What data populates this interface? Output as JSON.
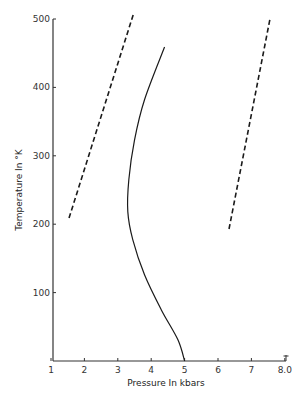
{
  "chart_data": {
    "type": "line",
    "title": "",
    "xlabel": "Pressure In kbars",
    "ylabel": "Temperature In °K",
    "xlim": [
      1,
      8.0
    ],
    "ylim": [
      0,
      500
    ],
    "x_ticks": [
      "1",
      "2",
      "3",
      "4",
      "5",
      "6",
      "7",
      "8.0"
    ],
    "y_ticks": [
      "100",
      "200",
      "300",
      "400",
      "500"
    ],
    "grid": false,
    "legend": null,
    "series": [
      {
        "name": "left-dashed-line",
        "style": "dashed",
        "points": [
          [
            1.54,
            209
          ],
          [
            3.46,
            506
          ]
        ]
      },
      {
        "name": "solid-curve",
        "style": "solid",
        "points": [
          [
            5.0,
            0
          ],
          [
            4.8,
            31
          ],
          [
            4.3,
            75
          ],
          [
            3.8,
            126
          ],
          [
            3.45,
            177
          ],
          [
            3.3,
            218
          ],
          [
            3.33,
            265
          ],
          [
            3.5,
            323
          ],
          [
            3.8,
            382
          ],
          [
            4.4,
            459
          ]
        ]
      },
      {
        "name": "right-dashed-line",
        "style": "dashed",
        "points": [
          [
            6.33,
            193
          ],
          [
            7.56,
            501
          ]
        ]
      }
    ]
  }
}
